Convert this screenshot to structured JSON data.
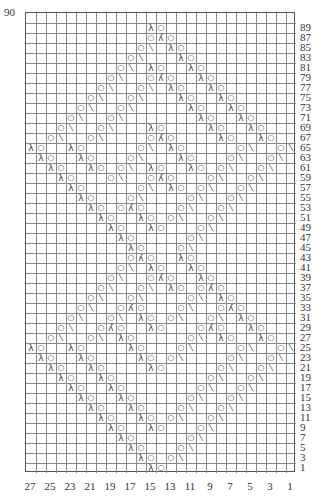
{
  "chart_data": {
    "type": "table",
    "columns": 27,
    "rows_shown": 46,
    "top_label": "90",
    "row_labels": [
      "89",
      "87",
      "85",
      "83",
      "81",
      "79",
      "77",
      "75",
      "73",
      "71",
      "69",
      "67",
      "65",
      "63",
      "61",
      "59",
      "57",
      "55",
      "53",
      "51",
      "49",
      "47",
      "45",
      "43",
      "41",
      "39",
      "37",
      "35",
      "33",
      "31",
      "29",
      "27",
      "25",
      "23",
      "21",
      "19",
      "17",
      "15",
      "13",
      "11",
      "9",
      "7",
      "5",
      "3",
      "1"
    ],
    "col_labels": [
      "27",
      "25",
      "23",
      "21",
      "19",
      "17",
      "15",
      "13",
      "11",
      "9",
      "7",
      "5",
      "3",
      "1"
    ],
    "legend": {
      "o": "yarn over",
      "/": "k2tog",
      "\\": "ssk",
      "A": "sk2p (double decrease)"
    },
    "rows": {
      "89": [
        [
          12,
          "\\"
        ],
        [
          13,
          "o"
        ]
      ],
      "87": [
        [
          12,
          "o"
        ],
        [
          13,
          "A"
        ],
        [
          14,
          "o"
        ]
      ],
      "85": [
        [
          11,
          "o"
        ],
        [
          12,
          "/"
        ],
        [
          14,
          "\\"
        ],
        [
          15,
          "o"
        ]
      ],
      "83": [
        [
          10,
          "o"
        ],
        [
          11,
          "/"
        ],
        [
          15,
          "\\"
        ],
        [
          16,
          "o"
        ]
      ],
      "81": [
        [
          9,
          "o"
        ],
        [
          10,
          "/"
        ],
        [
          12,
          "\\"
        ],
        [
          13,
          "o"
        ],
        [
          16,
          "\\"
        ],
        [
          17,
          "o"
        ]
      ],
      "79": [
        [
          8,
          "o"
        ],
        [
          9,
          "/"
        ],
        [
          12,
          "o"
        ],
        [
          13,
          "A"
        ],
        [
          14,
          "o"
        ],
        [
          17,
          "\\"
        ],
        [
          18,
          "o"
        ]
      ],
      "77": [
        [
          7,
          "o"
        ],
        [
          8,
          "/"
        ],
        [
          11,
          "o"
        ],
        [
          12,
          "/"
        ],
        [
          14,
          "\\"
        ],
        [
          15,
          "o"
        ],
        [
          18,
          "\\"
        ],
        [
          19,
          "o"
        ]
      ],
      "75": [
        [
          6,
          "o"
        ],
        [
          7,
          "/"
        ],
        [
          10,
          "o"
        ],
        [
          11,
          "/"
        ],
        [
          15,
          "\\"
        ],
        [
          16,
          "o"
        ],
        [
          19,
          "\\"
        ],
        [
          20,
          "o"
        ]
      ],
      "73": [
        [
          5,
          "o"
        ],
        [
          6,
          "/"
        ],
        [
          9,
          "o"
        ],
        [
          10,
          "/"
        ],
        [
          16,
          "\\"
        ],
        [
          17,
          "o"
        ],
        [
          20,
          "\\"
        ],
        [
          21,
          "o"
        ]
      ],
      "71": [
        [
          4,
          "o"
        ],
        [
          5,
          "/"
        ],
        [
          8,
          "o"
        ],
        [
          9,
          "/"
        ],
        [
          17,
          "\\"
        ],
        [
          18,
          "o"
        ],
        [
          21,
          "\\"
        ],
        [
          22,
          "o"
        ]
      ],
      "69": [
        [
          3,
          "o"
        ],
        [
          4,
          "/"
        ],
        [
          7,
          "o"
        ],
        [
          8,
          "/"
        ],
        [
          12,
          "\\"
        ],
        [
          13,
          "o"
        ],
        [
          18,
          "\\"
        ],
        [
          19,
          "o"
        ],
        [
          22,
          "\\"
        ],
        [
          23,
          "o"
        ]
      ],
      "67": [
        [
          2,
          "o"
        ],
        [
          3,
          "/"
        ],
        [
          6,
          "o"
        ],
        [
          7,
          "/"
        ],
        [
          12,
          "o"
        ],
        [
          13,
          "A"
        ],
        [
          14,
          "o"
        ],
        [
          19,
          "\\"
        ],
        [
          20,
          "o"
        ],
        [
          23,
          "\\"
        ],
        [
          24,
          "o"
        ]
      ],
      "65": [
        [
          0,
          "\\"
        ],
        [
          1,
          "o"
        ],
        [
          4,
          "\\"
        ],
        [
          5,
          "o"
        ],
        [
          11,
          "o"
        ],
        [
          12,
          "/"
        ],
        [
          14,
          "\\"
        ],
        [
          15,
          "o"
        ],
        [
          21,
          "o"
        ],
        [
          22,
          "/"
        ],
        [
          25,
          "o"
        ],
        [
          26,
          "/"
        ]
      ],
      "63": [
        [
          1,
          "\\"
        ],
        [
          2,
          "o"
        ],
        [
          5,
          "\\"
        ],
        [
          6,
          "o"
        ],
        [
          10,
          "o"
        ],
        [
          11,
          "/"
        ],
        [
          15,
          "\\"
        ],
        [
          16,
          "o"
        ],
        [
          20,
          "o"
        ],
        [
          21,
          "/"
        ],
        [
          24,
          "o"
        ],
        [
          25,
          "/"
        ]
      ],
      "61": [
        [
          2,
          "\\"
        ],
        [
          3,
          "o"
        ],
        [
          6,
          "\\"
        ],
        [
          7,
          "o"
        ],
        [
          9,
          "o"
        ],
        [
          10,
          "/"
        ],
        [
          12,
          "\\"
        ],
        [
          13,
          "o"
        ],
        [
          16,
          "\\"
        ],
        [
          17,
          "o"
        ],
        [
          19,
          "o"
        ],
        [
          20,
          "/"
        ],
        [
          23,
          "o"
        ],
        [
          24,
          "/"
        ]
      ],
      "59": [
        [
          3,
          "\\"
        ],
        [
          4,
          "o"
        ],
        [
          8,
          "o"
        ],
        [
          9,
          "/"
        ],
        [
          12,
          "o"
        ],
        [
          13,
          "A"
        ],
        [
          14,
          "o"
        ],
        [
          18,
          "o"
        ],
        [
          19,
          "/"
        ],
        [
          22,
          "o"
        ],
        [
          23,
          "/"
        ]
      ],
      "57": [
        [
          4,
          "\\"
        ],
        [
          5,
          "o"
        ],
        [
          11,
          "o"
        ],
        [
          12,
          "/"
        ],
        [
          14,
          "\\"
        ],
        [
          15,
          "o"
        ],
        [
          17,
          "o"
        ],
        [
          18,
          "/"
        ],
        [
          21,
          "o"
        ],
        [
          22,
          "/"
        ]
      ],
      "55": [
        [
          5,
          "\\"
        ],
        [
          6,
          "o"
        ],
        [
          10,
          "o"
        ],
        [
          11,
          "/"
        ],
        [
          16,
          "o"
        ],
        [
          17,
          "/"
        ],
        [
          20,
          "o"
        ],
        [
          21,
          "/"
        ]
      ],
      "53": [
        [
          6,
          "\\"
        ],
        [
          7,
          "o"
        ],
        [
          9,
          "o"
        ],
        [
          10,
          "A"
        ],
        [
          11,
          "o"
        ],
        [
          15,
          "o"
        ],
        [
          16,
          "/"
        ],
        [
          19,
          "o"
        ],
        [
          20,
          "/"
        ]
      ],
      "51": [
        [
          7,
          "\\"
        ],
        [
          8,
          "o"
        ],
        [
          11,
          "\\"
        ],
        [
          12,
          "o"
        ],
        [
          14,
          "o"
        ],
        [
          15,
          "/"
        ],
        [
          18,
          "o"
        ],
        [
          19,
          "/"
        ]
      ],
      "49": [
        [
          8,
          "\\"
        ],
        [
          9,
          "o"
        ],
        [
          12,
          "\\"
        ],
        [
          13,
          "o"
        ],
        [
          17,
          "o"
        ],
        [
          18,
          "/"
        ]
      ],
      "47": [
        [
          9,
          "\\"
        ],
        [
          10,
          "o"
        ],
        [
          16,
          "o"
        ],
        [
          17,
          "/"
        ]
      ],
      "45": [
        [
          10,
          "\\"
        ],
        [
          11,
          "o"
        ],
        [
          15,
          "o"
        ],
        [
          16,
          "/"
        ]
      ],
      "43": [
        [
          10,
          "o"
        ],
        [
          11,
          "A"
        ],
        [
          12,
          "o"
        ],
        [
          15,
          "\\"
        ],
        [
          16,
          "o"
        ]
      ],
      "41": [
        [
          9,
          "o"
        ],
        [
          10,
          "/"
        ],
        [
          12,
          "\\"
        ],
        [
          13,
          "o"
        ],
        [
          16,
          "\\"
        ],
        [
          17,
          "o"
        ]
      ],
      "39": [
        [
          8,
          "o"
        ],
        [
          9,
          "/"
        ],
        [
          12,
          "o"
        ],
        [
          13,
          "A"
        ],
        [
          14,
          "o"
        ],
        [
          17,
          "\\"
        ],
        [
          18,
          "o"
        ]
      ],
      "37": [
        [
          7,
          "o"
        ],
        [
          8,
          "/"
        ],
        [
          11,
          "o"
        ],
        [
          12,
          "/"
        ],
        [
          14,
          "\\"
        ],
        [
          15,
          "o"
        ],
        [
          17,
          "o"
        ],
        [
          18,
          "A"
        ],
        [
          19,
          "o"
        ]
      ],
      "35": [
        [
          6,
          "o"
        ],
        [
          7,
          "/"
        ],
        [
          10,
          "o"
        ],
        [
          11,
          "/"
        ],
        [
          16,
          "o"
        ],
        [
          17,
          "/"
        ],
        [
          19,
          "\\"
        ],
        [
          20,
          "o"
        ]
      ],
      "33": [
        [
          5,
          "o"
        ],
        [
          6,
          "/"
        ],
        [
          9,
          "o"
        ],
        [
          10,
          "A"
        ],
        [
          11,
          "o"
        ],
        [
          15,
          "o"
        ],
        [
          16,
          "/"
        ],
        [
          19,
          "o"
        ],
        [
          20,
          "A"
        ],
        [
          21,
          "o"
        ]
      ],
      "31": [
        [
          4,
          "o"
        ],
        [
          5,
          "/"
        ],
        [
          8,
          "o"
        ],
        [
          9,
          "/"
        ],
        [
          11,
          "\\"
        ],
        [
          12,
          "o"
        ],
        [
          14,
          "o"
        ],
        [
          15,
          "/"
        ],
        [
          18,
          "o"
        ],
        [
          19,
          "/"
        ],
        [
          21,
          "\\"
        ],
        [
          22,
          "o"
        ]
      ],
      "29": [
        [
          3,
          "o"
        ],
        [
          4,
          "/"
        ],
        [
          7,
          "o"
        ],
        [
          8,
          "A"
        ],
        [
          9,
          "o"
        ],
        [
          12,
          "\\"
        ],
        [
          13,
          "o"
        ],
        [
          17,
          "o"
        ],
        [
          18,
          "A"
        ],
        [
          19,
          "o"
        ],
        [
          22,
          "\\"
        ],
        [
          23,
          "o"
        ]
      ],
      "27": [
        [
          2,
          "o"
        ],
        [
          3,
          "/"
        ],
        [
          6,
          "o"
        ],
        [
          7,
          "/"
        ],
        [
          9,
          "\\"
        ],
        [
          10,
          "o"
        ],
        [
          16,
          "o"
        ],
        [
          17,
          "/"
        ],
        [
          19,
          "\\"
        ],
        [
          20,
          "o"
        ],
        [
          23,
          "\\"
        ],
        [
          24,
          "o"
        ]
      ],
      "25": [
        [
          0,
          "\\"
        ],
        [
          1,
          "o"
        ],
        [
          4,
          "\\"
        ],
        [
          5,
          "o"
        ],
        [
          10,
          "\\"
        ],
        [
          11,
          "o"
        ],
        [
          15,
          "o"
        ],
        [
          16,
          "/"
        ],
        [
          21,
          "o"
        ],
        [
          22,
          "/"
        ],
        [
          25,
          "o"
        ],
        [
          26,
          "/"
        ]
      ],
      "23": [
        [
          1,
          "\\"
        ],
        [
          2,
          "o"
        ],
        [
          5,
          "\\"
        ],
        [
          6,
          "o"
        ],
        [
          11,
          "\\"
        ],
        [
          12,
          "o"
        ],
        [
          14,
          "o"
        ],
        [
          15,
          "/"
        ],
        [
          20,
          "o"
        ],
        [
          21,
          "/"
        ],
        [
          24,
          "o"
        ],
        [
          25,
          "/"
        ]
      ],
      "21": [
        [
          2,
          "\\"
        ],
        [
          3,
          "o"
        ],
        [
          6,
          "\\"
        ],
        [
          7,
          "o"
        ],
        [
          12,
          "\\"
        ],
        [
          13,
          "o"
        ],
        [
          19,
          "o"
        ],
        [
          20,
          "/"
        ],
        [
          23,
          "o"
        ],
        [
          24,
          "/"
        ]
      ],
      "19": [
        [
          3,
          "\\"
        ],
        [
          4,
          "o"
        ],
        [
          7,
          "\\"
        ],
        [
          8,
          "o"
        ],
        [
          18,
          "o"
        ],
        [
          19,
          "/"
        ],
        [
          22,
          "o"
        ],
        [
          23,
          "/"
        ]
      ],
      "17": [
        [
          4,
          "\\"
        ],
        [
          5,
          "o"
        ],
        [
          8,
          "\\"
        ],
        [
          9,
          "o"
        ],
        [
          17,
          "o"
        ],
        [
          18,
          "/"
        ],
        [
          21,
          "o"
        ],
        [
          22,
          "/"
        ]
      ],
      "15": [
        [
          5,
          "\\"
        ],
        [
          6,
          "o"
        ],
        [
          9,
          "\\"
        ],
        [
          10,
          "o"
        ],
        [
          16,
          "o"
        ],
        [
          17,
          "/"
        ],
        [
          20,
          "o"
        ],
        [
          21,
          "/"
        ]
      ],
      "13": [
        [
          6,
          "\\"
        ],
        [
          7,
          "o"
        ],
        [
          10,
          "\\"
        ],
        [
          11,
          "o"
        ],
        [
          15,
          "o"
        ],
        [
          16,
          "/"
        ],
        [
          19,
          "o"
        ],
        [
          20,
          "/"
        ]
      ],
      "11": [
        [
          7,
          "\\"
        ],
        [
          8,
          "o"
        ],
        [
          11,
          "\\"
        ],
        [
          12,
          "o"
        ],
        [
          14,
          "o"
        ],
        [
          15,
          "/"
        ],
        [
          18,
          "o"
        ],
        [
          19,
          "/"
        ]
      ],
      "9": [
        [
          8,
          "\\"
        ],
        [
          9,
          "o"
        ],
        [
          12,
          "\\"
        ],
        [
          13,
          "o"
        ],
        [
          17,
          "o"
        ],
        [
          18,
          "/"
        ]
      ],
      "7": [
        [
          9,
          "\\"
        ],
        [
          10,
          "o"
        ],
        [
          16,
          "o"
        ],
        [
          17,
          "/"
        ]
      ],
      "5": [
        [
          10,
          "\\"
        ],
        [
          11,
          "o"
        ],
        [
          15,
          "o"
        ],
        [
          16,
          "/"
        ]
      ],
      "3": [
        [
          11,
          "\\"
        ],
        [
          12,
          "o"
        ],
        [
          14,
          "o"
        ],
        [
          15,
          "/"
        ]
      ],
      "1": [
        [
          12,
          "\\"
        ],
        [
          13,
          "o"
        ]
      ]
    }
  }
}
